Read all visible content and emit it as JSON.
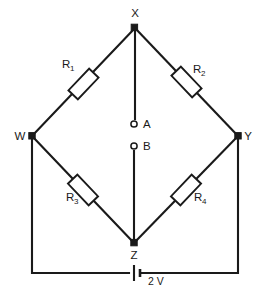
{
  "figure": {
    "background_color": "#ffffff",
    "line_color": "#1a1a1a"
  },
  "nodes": [
    {
      "id": "X",
      "label": "X",
      "x": 135,
      "y": 28,
      "label_x": 135,
      "label_y": 17
    },
    {
      "id": "W",
      "label": "W",
      "x": 32,
      "y": 136,
      "label_x": 20,
      "label_y": 140
    },
    {
      "id": "Y",
      "label": "Y",
      "x": 238,
      "y": 136,
      "label_x": 248,
      "label_y": 140
    },
    {
      "id": "Z",
      "label": "Z",
      "x": 134,
      "y": 243,
      "label_x": 134,
      "label_y": 259
    }
  ],
  "terminals": [
    {
      "id": "A",
      "label": "A",
      "x": 134,
      "y": 124,
      "label_x": 144,
      "label_y": 128
    },
    {
      "id": "B",
      "label": "B",
      "x": 134,
      "y": 146,
      "label_x": 144,
      "label_y": 150
    }
  ],
  "resistors": [
    {
      "id": "R1",
      "letter": "R",
      "subscript": "1",
      "label_x": 68,
      "label_y": 68,
      "branch": "W-X"
    },
    {
      "id": "R2",
      "letter": "R",
      "subscript": "2",
      "label_x": 199,
      "label_y": 73,
      "branch": "X-Y"
    },
    {
      "id": "R3",
      "letter": "R",
      "subscript": "3",
      "label_x": 72,
      "label_y": 201,
      "branch": "W-Z"
    },
    {
      "id": "R4",
      "letter": "R",
      "subscript": "4",
      "label_x": 200,
      "label_y": 201,
      "branch": "Z-Y"
    }
  ],
  "battery": {
    "label": "2 V",
    "label_x": 150,
    "label_y": 285,
    "x": 135,
    "y": 273
  }
}
